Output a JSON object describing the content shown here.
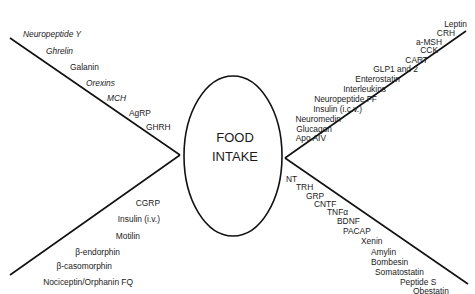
{
  "diagram": {
    "center": {
      "line1": "FOOD",
      "line2": "INTAKE"
    },
    "upper_left": {
      "description": "orexigenic (stimulate food intake, centrally)",
      "items": [
        {
          "label": "Neuropeptide Y",
          "italic": true
        },
        {
          "label": "Ghrelin",
          "italic": true
        },
        {
          "label": "Galanin",
          "italic": false
        },
        {
          "label": "Orexins",
          "italic": true
        },
        {
          "label": "MCH",
          "italic": true
        },
        {
          "label": "AgRP",
          "italic": false
        },
        {
          "label": "GHRH",
          "italic": false
        }
      ]
    },
    "lower_left": {
      "items": [
        {
          "label": "CGRP"
        },
        {
          "label": "Insulin (i.v.)"
        },
        {
          "label": "Motilin"
        },
        {
          "label": "β-endorphin"
        },
        {
          "label": "β-casomorphin"
        },
        {
          "label": "Nociceptin/Orphanin FQ"
        }
      ]
    },
    "upper_right": {
      "items": [
        {
          "label": "Leptin"
        },
        {
          "label": "CRH"
        },
        {
          "label": "a-MSH"
        },
        {
          "label": "CCK"
        },
        {
          "label": "CART"
        },
        {
          "label": "GLP1 and 2"
        },
        {
          "label": "Enterostatin"
        },
        {
          "label": "Interleukins"
        },
        {
          "label": "Neuropeptide FF"
        },
        {
          "label": "Insulin (i.c.v.)"
        },
        {
          "label": "Neuromedin"
        },
        {
          "label": "Glucagon"
        },
        {
          "label": "Apo AIV"
        }
      ]
    },
    "lower_right": {
      "items": [
        {
          "label": "NT"
        },
        {
          "label": "TRH"
        },
        {
          "label": "GRP"
        },
        {
          "label": "CNTF"
        },
        {
          "label": "TNFα"
        },
        {
          "label": "BDNF"
        },
        {
          "label": "PACAP"
        },
        {
          "label": "Xenin"
        },
        {
          "label": "Amylin"
        },
        {
          "label": "Bombesin"
        },
        {
          "label": "Somatostatin"
        },
        {
          "label": "Peptide S"
        },
        {
          "label": "Obestatin"
        }
      ]
    }
  }
}
